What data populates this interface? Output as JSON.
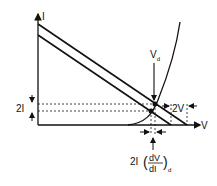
{
  "diagram": {
    "type": "load-line I-V characteristic",
    "axes": {
      "y_label": "I",
      "x_label": "V"
    },
    "labels": {
      "vd": "V",
      "vd_sub": "d",
      "two_i": "2I",
      "two_v": "2V",
      "bottom_prefix": "2I",
      "bottom_num": "dV",
      "bottom_den": "dI",
      "bottom_sub": "d"
    },
    "elements": [
      "upper load line",
      "lower load line",
      "diode exponential curve",
      "dotted current levels",
      "dashed voltage markers"
    ],
    "colors": {
      "line": "#111111",
      "background": "#ffffff"
    }
  }
}
